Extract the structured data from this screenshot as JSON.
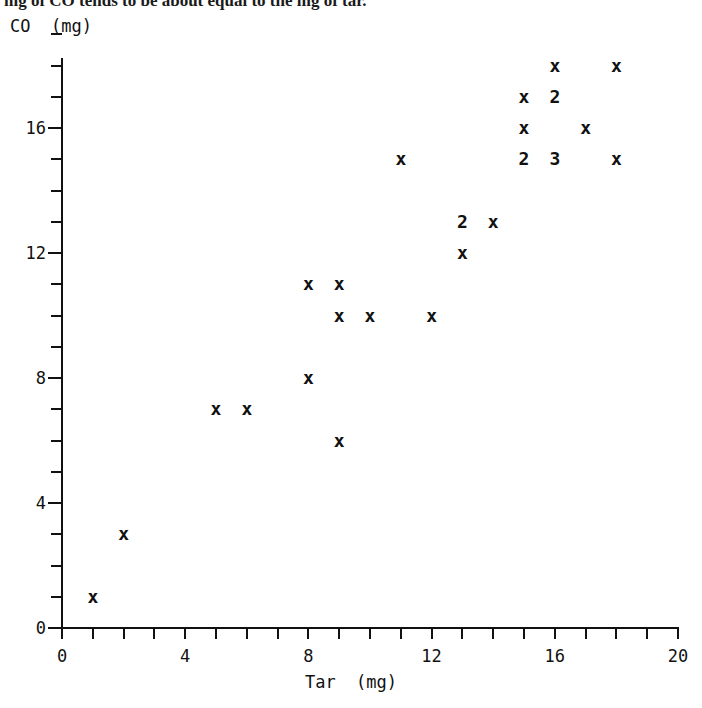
{
  "caption": {
    "text": "mg of CO tends to be about equal to the mg of tar."
  },
  "chart_data": {
    "type": "scatter",
    "title": "",
    "xlabel": "Tar  (mg)",
    "ylabel": "CO  (mg)",
    "xlim": [
      0,
      20
    ],
    "ylim": [
      0,
      19
    ],
    "grid": false,
    "legend": null,
    "x_tick_labels": [
      "0",
      "4",
      "8",
      "12",
      "16",
      "20"
    ],
    "x_tick_values": [
      0,
      4,
      8,
      12,
      16,
      20
    ],
    "x_minor_tick_step": 1,
    "y_tick_labels": [
      "0",
      "4",
      "8",
      "12",
      "16"
    ],
    "y_tick_values": [
      0,
      4,
      8,
      12,
      16
    ],
    "y_minor_tick_step": 1,
    "marker_symbol": "x",
    "note": "Overlapping observations are drawn as a digit giving the count at that coordinate.",
    "points": [
      {
        "x": 1,
        "y": 1,
        "count": 1,
        "label": "x"
      },
      {
        "x": 2,
        "y": 3,
        "count": 1,
        "label": "x"
      },
      {
        "x": 5,
        "y": 7,
        "count": 1,
        "label": "x"
      },
      {
        "x": 6,
        "y": 7,
        "count": 1,
        "label": "x"
      },
      {
        "x": 9,
        "y": 6,
        "count": 1,
        "label": "x"
      },
      {
        "x": 8,
        "y": 8,
        "count": 1,
        "label": "x"
      },
      {
        "x": 9,
        "y": 10,
        "count": 1,
        "label": "x"
      },
      {
        "x": 10,
        "y": 10,
        "count": 1,
        "label": "x"
      },
      {
        "x": 12,
        "y": 10,
        "count": 1,
        "label": "x"
      },
      {
        "x": 8,
        "y": 11,
        "count": 1,
        "label": "x"
      },
      {
        "x": 9,
        "y": 11,
        "count": 1,
        "label": "x"
      },
      {
        "x": 13,
        "y": 12,
        "count": 1,
        "label": "x"
      },
      {
        "x": 13,
        "y": 13,
        "count": 2,
        "label": "2"
      },
      {
        "x": 14,
        "y": 13,
        "count": 1,
        "label": "x"
      },
      {
        "x": 11,
        "y": 15,
        "count": 1,
        "label": "x"
      },
      {
        "x": 15,
        "y": 15,
        "count": 2,
        "label": "2"
      },
      {
        "x": 16,
        "y": 15,
        "count": 3,
        "label": "3"
      },
      {
        "x": 18,
        "y": 15,
        "count": 1,
        "label": "x"
      },
      {
        "x": 15,
        "y": 16,
        "count": 1,
        "label": "x"
      },
      {
        "x": 17,
        "y": 16,
        "count": 1,
        "label": "x"
      },
      {
        "x": 15,
        "y": 17,
        "count": 1,
        "label": "x"
      },
      {
        "x": 16,
        "y": 17,
        "count": 2,
        "label": "2"
      },
      {
        "x": 16,
        "y": 18,
        "count": 1,
        "label": "x"
      },
      {
        "x": 18,
        "y": 18,
        "count": 1,
        "label": "x"
      }
    ]
  },
  "geometry": {
    "origin_px": {
      "x": 62,
      "y": 628
    },
    "px_per_x_unit": 30.8,
    "px_per_y_unit": 31.25,
    "y_axis_top_px": 58,
    "x_axis_right_px": 678,
    "tick_len_px": 11
  }
}
